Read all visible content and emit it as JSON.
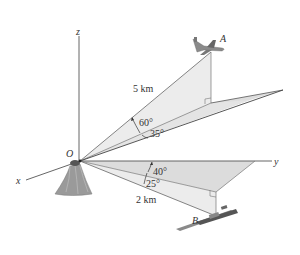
{
  "figure": {
    "axes": {
      "x": "x",
      "y": "y",
      "z": "z"
    },
    "origin_label": "O",
    "point_a_label": "A",
    "point_b_label": "B",
    "distance_a": "5 km",
    "distance_b": "2 km",
    "angle_a_elevation": "60°",
    "angle_a_azimuth": "35°",
    "angle_b_azimuth": "40°",
    "angle_b_depression": "25°",
    "colors": {
      "shade_light": "#ececec",
      "shade_mid": "#dcdcdc",
      "line": "#444444"
    }
  }
}
